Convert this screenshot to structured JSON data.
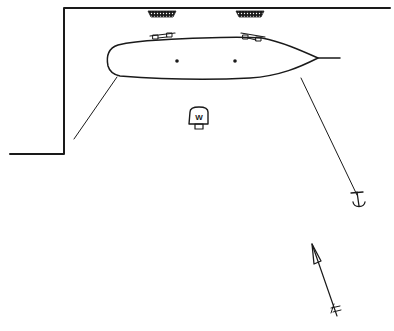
{
  "diagram": {
    "type": "mooring-diagram",
    "elements": [
      {
        "id": "quay-wall",
        "label": "quay wall"
      },
      {
        "id": "vessel",
        "label": "moored vessel"
      },
      {
        "id": "fender-1",
        "label": "fender"
      },
      {
        "id": "fender-2",
        "label": "fender"
      },
      {
        "id": "bollard-1",
        "label": "bollard"
      },
      {
        "id": "bollard-2",
        "label": "bollard"
      },
      {
        "id": "mooring-line-stern",
        "label": "mooring line"
      },
      {
        "id": "mooring-line-bow",
        "label": "anchor line"
      },
      {
        "id": "winch",
        "label": "W"
      },
      {
        "id": "anchor",
        "label": "anchor"
      },
      {
        "id": "direction-arrow",
        "label": "direction arrow"
      }
    ],
    "winch_label": "W",
    "colors": {
      "ink": "#1a1a1a",
      "background": "#ffffff"
    }
  }
}
